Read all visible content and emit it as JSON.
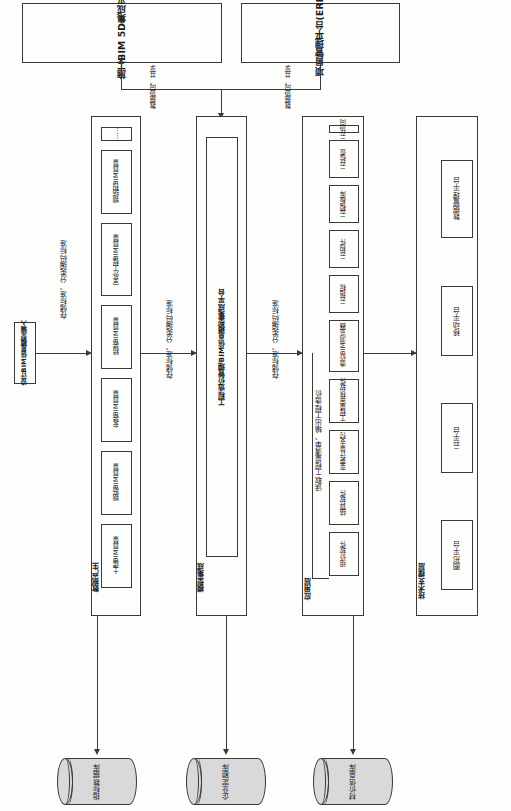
{
  "diagram": {
    "orientation": "rotated-90-ccw",
    "top_platforms": [
      {
        "id": "construction",
        "label": "施工BIM 5D集成平台"
      },
      {
        "id": "erp",
        "label": "项目管理平台(ERP)"
      }
    ],
    "connector_labels": {
      "share_left": "数据协同，共享",
      "share_right": "数据协同，共享",
      "storage_standard_1": "存储标准、分类编码标准",
      "storage_standard_2": "存储标准、分类编码标准",
      "storage_standard_3": "存储标准、分类编码标准",
      "read_output": "读取工程量清单、输出工程造价"
    },
    "input_node": {
      "label": "设计BIM信息模型输入"
    },
    "layers": [
      {
        "id": "data-generation",
        "label": "数据产生",
        "items": [
          "土建BIM算量",
          "钢筋BIM算量",
          "安装BIM算量",
          "精装BIM算量",
          "室外工程BIM算量",
          "钢结构BIM算量",
          "……"
        ]
      },
      {
        "id": "model-integration",
        "label": "模型集成",
        "items": [
          "工程造价管理BIM信息模型集成平台"
        ]
      },
      {
        "id": "application",
        "label": "应用层",
        "items": [
          "组价软件",
          "结算软件",
          "变更计量支付",
          "工程量审核软件",
          "造价BIM浏览器",
          "云指标",
          "云构件",
          "云模板库",
          "云检查",
          "云协同"
        ]
      },
      {
        "id": "technical-support",
        "label": "技术支撑层",
        "items": [
          "图形平台",
          "云平台",
          "移动平台",
          "数据管理平台"
        ]
      }
    ],
    "databases": [
      {
        "id": "indicator",
        "label": "指标数据库"
      },
      {
        "id": "enterprise-quota",
        "label": "企业定额库"
      },
      {
        "id": "material-price",
        "label": "材价信息库"
      }
    ],
    "colors": {
      "stroke": "#3a3a3a",
      "page": "#fdfdfb",
      "cylinder_fill": "#d9d9d9"
    }
  }
}
